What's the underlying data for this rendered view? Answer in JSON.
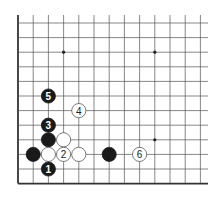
{
  "diagram": {
    "type": "go-board-corner",
    "colors": {
      "background": "#ffffff",
      "grid": "#555555",
      "edge": "#333333",
      "black_stone": "#1a1a1a",
      "white_stone": "#ffffff",
      "white_stone_border": "#444444"
    },
    "grid": {
      "columns": 13,
      "rows": 12,
      "left_edge": true,
      "bottom_edge": true
    },
    "star_points": [
      {
        "col": 3,
        "row": 2
      },
      {
        "col": 9,
        "row": 2
      },
      {
        "col": 9,
        "row": 8
      }
    ],
    "stones": [
      {
        "color": "black",
        "col": 2,
        "row": 8,
        "label": ""
      },
      {
        "color": "white",
        "col": 3,
        "row": 8,
        "label": ""
      },
      {
        "color": "black",
        "col": 1,
        "row": 9,
        "label": ""
      },
      {
        "color": "white",
        "col": 2,
        "row": 9,
        "label": ""
      },
      {
        "color": "white",
        "col": 3,
        "row": 9,
        "label": "2"
      },
      {
        "color": "white",
        "col": 4,
        "row": 9,
        "label": ""
      },
      {
        "color": "black",
        "col": 6,
        "row": 9,
        "label": ""
      },
      {
        "color": "white",
        "col": 8,
        "row": 9,
        "label": "6"
      },
      {
        "color": "black",
        "col": 2,
        "row": 10,
        "label": "1"
      },
      {
        "color": "black",
        "col": 2,
        "row": 7,
        "label": "3"
      },
      {
        "color": "white",
        "col": 4,
        "row": 6,
        "label": "4"
      },
      {
        "color": "black",
        "col": 2,
        "row": 5,
        "label": "5"
      }
    ]
  }
}
